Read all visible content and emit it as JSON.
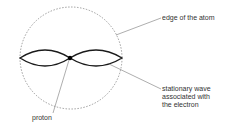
{
  "diagram": {
    "labels": {
      "edge": "edge of the atom",
      "wave": "stationary wave\nassociated with\nthe electron",
      "proton": "proton"
    },
    "colors": {
      "stroke": "#1a1a1a",
      "leader": "#777777",
      "dashed_circle": "#777777"
    }
  }
}
